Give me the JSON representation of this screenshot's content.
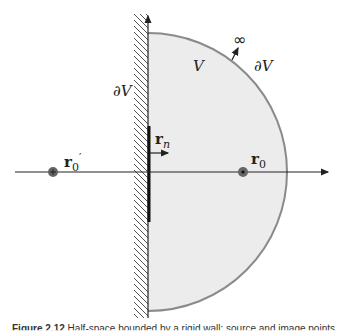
{
  "diagram": {
    "labels": {
      "volume": "V",
      "boundary_left": "∂V",
      "boundary_right": "∂V",
      "infinity": "∞",
      "normal_vector": "r",
      "normal_vector_sub": "n",
      "source_point": "r",
      "source_point_sub": "0",
      "image_point": "r",
      "image_point_sub": "0",
      "image_point_prime": "′"
    },
    "colors": {
      "region_fill": "#ececec",
      "arc_stroke": "#8a8a8a",
      "axis": "#222222",
      "hatch": "#555555",
      "point": "#555555"
    }
  },
  "caption": {
    "prefix": "Figure 2.12",
    "text": "Half-space bounded by a rigid wall; source and image points."
  }
}
